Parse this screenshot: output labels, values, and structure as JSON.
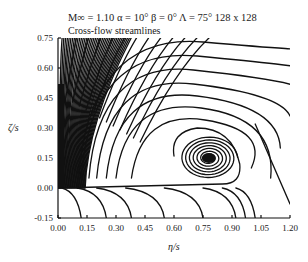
{
  "chart_data": {
    "type": "line",
    "title": "Cross-flow streamlines",
    "subtitle": "M∞ = 1.10   α = 10°   β = 0°   Λ = 75°   128 x 128",
    "params": {
      "mach": "1.10",
      "alpha": "10°",
      "beta": "0°",
      "sweep": "75°",
      "grid": "128 x 128"
    },
    "xlabel": "η/s",
    "ylabel": "ζ/s",
    "xlim": [
      0.0,
      1.2
    ],
    "ylim": [
      -0.15,
      0.75
    ],
    "xticks": [
      "0.00",
      "0.15",
      "0.30",
      "0.45",
      "0.60",
      "0.75",
      "0.90",
      "1.05",
      "1.20"
    ],
    "yticks": [
      "-0.15",
      "0.00",
      "0.15",
      "0.30",
      "0.45",
      "0.60",
      "0.75"
    ],
    "grid": false,
    "vortex_center": {
      "x": 0.78,
      "y": 0.15
    },
    "series": [
      {
        "name": "outer-arc",
        "x": [
          0.3,
          0.5,
          0.75,
          1.0,
          1.2
        ],
        "y": [
          0.75,
          0.72,
          0.73,
          0.72,
          0.7
        ]
      },
      {
        "name": "arc-2",
        "x": [
          0.2,
          0.4,
          0.65,
          0.9,
          1.1,
          1.2
        ],
        "y": [
          0.68,
          0.72,
          0.68,
          0.66,
          0.64,
          0.62
        ]
      },
      {
        "name": "arc-3",
        "x": [
          0.15,
          0.35,
          0.6,
          0.85,
          1.05,
          1.2
        ],
        "y": [
          0.6,
          0.64,
          0.63,
          0.6,
          0.56,
          0.52
        ]
      },
      {
        "name": "arc-4",
        "x": [
          0.12,
          0.3,
          0.55,
          0.8,
          1.0,
          1.2
        ],
        "y": [
          0.5,
          0.56,
          0.57,
          0.53,
          0.46,
          0.38
        ]
      },
      {
        "name": "arc-5",
        "x": [
          0.1,
          0.25,
          0.5,
          0.75,
          0.95,
          1.1,
          1.2
        ],
        "y": [
          0.4,
          0.48,
          0.51,
          0.47,
          0.38,
          0.22,
          0.08
        ]
      },
      {
        "name": "separatrix",
        "x": [
          0.0,
          0.3,
          0.6,
          0.85,
          0.93,
          0.95
        ],
        "y": [
          0.0,
          0.02,
          0.02,
          0.02,
          0.03,
          0.1
        ]
      }
    ]
  }
}
